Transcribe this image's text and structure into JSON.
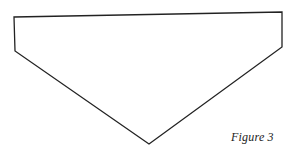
{
  "figure": {
    "caption": "Figure 3",
    "shape": {
      "type": "pentagon",
      "vertices": [
        [
          14,
          17
        ],
        [
          282,
          12
        ],
        [
          282,
          47
        ],
        [
          149,
          144
        ],
        [
          15,
          51
        ]
      ],
      "stroke": "#222222",
      "stroke_width": 1.3,
      "fill": "#ffffff"
    }
  }
}
